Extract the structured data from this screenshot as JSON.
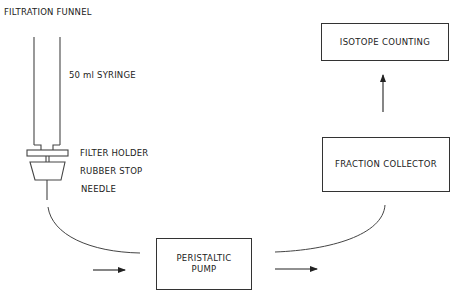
{
  "diagram": {
    "labels": {
      "filtration_funnel": "FILTRATION FUNNEL",
      "syringe": "50 ml SYRINGE",
      "filter_holder": "FILTER HOLDER",
      "rubber_stop": "RUBBER STOP",
      "needle": "NEEDLE"
    },
    "boxes": {
      "pump_line1": "PERISTALTIC",
      "pump_line2": "PUMP",
      "fraction_collector": "FRACTION COLLECTOR",
      "isotope_counting": "ISOTOPE COUNTING"
    },
    "flow": [
      "Filtration Funnel",
      "Peristaltic Pump",
      "Fraction Collector",
      "Isotope Counting"
    ],
    "colors": {
      "line": "#333333",
      "background": "#ffffff"
    }
  }
}
